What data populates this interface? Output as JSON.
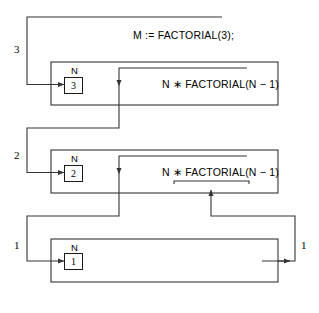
{
  "diagram": {
    "title_call": "M := FACTORIAL(3);",
    "frames": [
      {
        "id": "frame-3",
        "depth_label": "3",
        "var_name": "N",
        "var_value": "3",
        "expression": "N ∗ FACTORIAL(N − 1)"
      },
      {
        "id": "frame-2",
        "depth_label": "2",
        "var_name": "N",
        "var_value": "2",
        "expression": "N ∗ FACTORIAL(N − 1)"
      },
      {
        "id": "frame-1",
        "depth_label": "1",
        "right_label": "1",
        "var_name": "N",
        "var_value": "1",
        "expression": ""
      }
    ],
    "colors": {
      "line": "#333333",
      "frame_border": "#333333",
      "box_border": "#1a1a1a",
      "text": "#000000",
      "background": "#ffffff"
    }
  }
}
